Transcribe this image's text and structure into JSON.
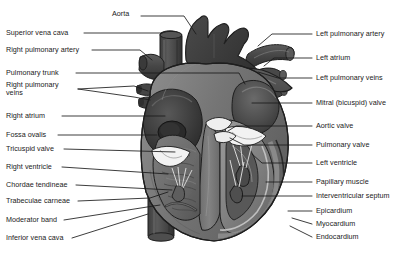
{
  "figure": {
    "style": "grayscale line-and-tone medical illustration",
    "background_color": "#ffffff",
    "label_text_color": "#1a1a1a",
    "leader_line_color": "#1a1a1a",
    "palette": {
      "outline": "#1e1e1e",
      "aorta_dark": "#3a3a3a",
      "vessel_mid": "#4a4a4a",
      "atrium_dark": "#363636",
      "myocardium_mid": "#6e6e6e",
      "chamber_light": "#8a8a8a",
      "cavity_pale": "#a3a3a3",
      "valve_white": "#f2f2f2",
      "highlight": "#c9c9c9"
    }
  },
  "labels": {
    "left": [
      {
        "id": "superior-vena-cava",
        "text": "Superior vena cava",
        "x": 6,
        "y": 31,
        "lines": 1
      },
      {
        "id": "right-pulmonary-artery",
        "text": "Right pulmonary artery",
        "x": 6,
        "y": 48,
        "lines": 1
      },
      {
        "id": "pulmonary-trunk",
        "text": "Pulmonary trunk",
        "x": 6,
        "y": 71,
        "lines": 1
      },
      {
        "id": "right-pulmonary-veins",
        "text": "Right pulmonary\nveins",
        "x": 6,
        "y": 88,
        "lines": 2
      },
      {
        "id": "right-atrium",
        "text": "Right atrium",
        "x": 6,
        "y": 114,
        "lines": 1
      },
      {
        "id": "fossa-ovalis",
        "text": "Fossa ovalis",
        "x": 6,
        "y": 133,
        "lines": 1
      },
      {
        "id": "tricuspid-valve",
        "text": "Tricuspid valve",
        "x": 6,
        "y": 147,
        "lines": 1
      },
      {
        "id": "right-ventricle",
        "text": "Right ventricle",
        "x": 6,
        "y": 165,
        "lines": 1
      },
      {
        "id": "chordae-tendineae",
        "text": "Chordae tendineae",
        "x": 6,
        "y": 183,
        "lines": 1
      },
      {
        "id": "trabeculae-carneae",
        "text": "Trabeculae carneae",
        "x": 6,
        "y": 199,
        "lines": 1
      },
      {
        "id": "moderator-band",
        "text": "Moderator band",
        "x": 6,
        "y": 218,
        "lines": 1
      },
      {
        "id": "inferior-vena-cava",
        "text": "Inferior vena cava",
        "x": 6,
        "y": 236,
        "lines": 1
      }
    ],
    "top": [
      {
        "id": "aorta",
        "text": "Aorta",
        "x": 112,
        "y": 14,
        "lines": 1
      }
    ],
    "right": [
      {
        "id": "left-pulmonary-artery",
        "text": "Left pulmonary artery",
        "x": 316,
        "y": 32,
        "lines": 1
      },
      {
        "id": "left-atrium",
        "text": "Left atrium",
        "x": 316,
        "y": 56,
        "lines": 1
      },
      {
        "id": "left-pulmonary-veins",
        "text": "Left pulmonary veins",
        "x": 316,
        "y": 76,
        "lines": 1
      },
      {
        "id": "mitral-bicuspid-valve",
        "text": "Mitral (bicuspid) valve",
        "x": 316,
        "y": 101,
        "lines": 1
      },
      {
        "id": "aortic-valve",
        "text": "Aortic valve",
        "x": 316,
        "y": 124,
        "lines": 1
      },
      {
        "id": "pulmonary-valve",
        "text": "Pulmonary valve",
        "x": 316,
        "y": 143,
        "lines": 1
      },
      {
        "id": "left-ventricle",
        "text": "Left ventricle",
        "x": 316,
        "y": 161,
        "lines": 1
      },
      {
        "id": "papillary-muscle",
        "text": "Papillary muscle",
        "x": 316,
        "y": 180,
        "lines": 1
      },
      {
        "id": "interventricular-septum",
        "text": "Interventricular septum",
        "x": 316,
        "y": 194,
        "lines": 1
      },
      {
        "id": "epicardium",
        "text": "Epicardium",
        "x": 316,
        "y": 209,
        "lines": 1
      },
      {
        "id": "myocardium",
        "text": "Myocardium",
        "x": 316,
        "y": 222,
        "lines": 1
      },
      {
        "id": "endocardium",
        "text": "Endocardium",
        "x": 316,
        "y": 235,
        "lines": 1
      }
    ]
  },
  "leaders": [
    {
      "id": "aorta",
      "points": "141,16 184,16 196,34"
    },
    {
      "id": "superior-vena-cava",
      "points": "84,33 162,33"
    },
    {
      "id": "right-pulmonary-artery",
      "points": "92,50 140,50 152,60"
    },
    {
      "id": "pulmonary-trunk",
      "points": "76,73 239,73 245,84"
    },
    {
      "id": "right-pulmonary-veins-a",
      "points": "78,89 134,86 148,91"
    },
    {
      "id": "right-pulmonary-veins-b",
      "points": "78,89 134,97 150,100"
    },
    {
      "id": "right-atrium",
      "points": "62,116 165,116"
    },
    {
      "id": "fossa-ovalis",
      "points": "58,135 157,135"
    },
    {
      "id": "tricuspid-valve",
      "points": "64,149 175,152"
    },
    {
      "id": "right-ventricle",
      "points": "62,167 168,174"
    },
    {
      "id": "chordae-tendineae",
      "points": "76,185 172,190"
    },
    {
      "id": "trabeculae-carneae",
      "points": "78,201 150,198 168,192"
    },
    {
      "id": "moderator-band",
      "points": "64,220 160,205"
    },
    {
      "id": "inferior-vena-cava",
      "points": "72,238 148,214"
    },
    {
      "id": "left-pulmonary-artery",
      "points": "312,34 272,34 258,46"
    },
    {
      "id": "left-atrium",
      "points": "312,58 274,58 264,66"
    },
    {
      "id": "left-pulmonary-veins",
      "points": "312,78 278,78 258,72"
    },
    {
      "id": "mitral-bicuspid-valve",
      "points": "312,103 252,103"
    },
    {
      "id": "aortic-valve",
      "points": "312,126 236,126 228,131"
    },
    {
      "id": "pulmonary-valve",
      "points": "312,145 244,145 230,138"
    },
    {
      "id": "left-ventricle",
      "points": "312,163 262,163 252,154"
    },
    {
      "id": "papillary-muscle",
      "points": "312,182 266,182"
    },
    {
      "id": "interventricular-septum",
      "points": "312,196 242,196"
    },
    {
      "id": "epicardium",
      "points": "312,211 288,211"
    },
    {
      "id": "myocardium",
      "points": "312,224 292,218"
    },
    {
      "id": "endocardium",
      "points": "312,237 290,226"
    }
  ]
}
